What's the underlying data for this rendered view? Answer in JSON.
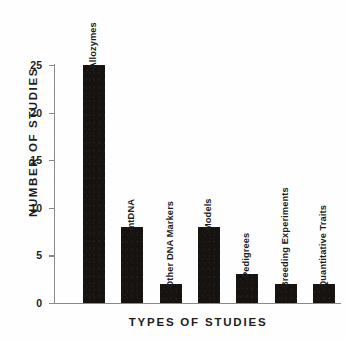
{
  "chart_data": {
    "type": "bar",
    "title": "",
    "xlabel": "TYPES OF STUDIES",
    "ylabel": "NUMBER OF STUDIES",
    "categories": [
      "Allozymes",
      "mtDNA",
      "Other DNA Markers",
      "Models",
      "Pedigrees",
      "Breeding Experiments",
      "Quantitative Traits"
    ],
    "values": [
      25,
      8,
      2,
      8,
      3,
      2,
      2
    ],
    "ylim": [
      0,
      25
    ],
    "yticks": [
      0,
      5,
      10,
      15,
      20,
      25
    ],
    "ytick_labels": [
      "0",
      "5",
      "10",
      "15",
      "20",
      "25"
    ],
    "grid": false,
    "legend": "none",
    "bar_color": "#151210",
    "axis_color": "#8a8a8a",
    "text_color": "#1c1c1c",
    "bar_label_orientation": "vertical-above-bar"
  }
}
